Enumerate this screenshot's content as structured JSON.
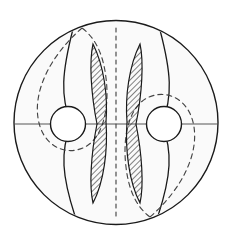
{
  "figure": {
    "canvas": {
      "width": 234,
      "height": 243
    },
    "colors": {
      "background": "#ffffff",
      "disk_fill": "#fafafa",
      "stroke": "#1a1a1a",
      "dashed_stroke": "#444444",
      "hole_fill": "#ffffff",
      "hatch_stroke": "#1a1a1a",
      "axis_line": "#555555"
    },
    "outer_disk": {
      "name": "outer-disk",
      "center_x": 116,
      "center_y": 122.5,
      "radius": 102,
      "stroke_width": 1.4
    },
    "holes": [
      {
        "name": "left-hole",
        "center_x": 68,
        "center_y": 124,
        "radius": 17.5
      },
      {
        "name": "right-hole",
        "center_x": 164,
        "center_y": 124,
        "radius": 17.5
      }
    ],
    "axis": {
      "name": "horizontal-diameter",
      "y": 124,
      "x_start": 14,
      "x_end": 218
    },
    "center_dashed_line": {
      "name": "center-dashed-line",
      "x": 116,
      "y_start": 28,
      "y_end": 218,
      "dash": "4 4"
    },
    "solid_arcs": [
      {
        "name": "left-solid-arc",
        "path": "M 73,29 C 62,72 60,96 71,124 C 60,152 62,176 75,216"
      },
      {
        "name": "right-solid-arc",
        "path": "M 160,30 C 171,72 173,96 162,124 C 173,152 171,176 158,216"
      }
    ],
    "dashed_loops": [
      {
        "name": "left-dashed-loop",
        "path": "M 82,28 C 48,58 34,92 38,118 C 42,145 64,156 83,148 C 102,140 110,110 106,78 C 103,52 94,37 82,28 Z",
        "dash": "5 4"
      },
      {
        "name": "right-dashed-loop",
        "path": "M 150,217 C 184,187 198,153 194,127 C 190,100 168,89 149,97 C 130,105 122,135 126,167 C 129,193 138,208 150,217 Z",
        "dash": "5 4"
      }
    ],
    "hatched_regions": [
      {
        "name": "left-hatched-crescent",
        "path": "M 93,44 C 104,66 108,96 106,122 C 108,150 104,182 93,203 C 89,186 91,154 97,124 C 91,94 89,62 93,44 Z",
        "hatch_angle_degrees": 45,
        "hatch_spacing": 4
      },
      {
        "name": "right-hatched-crescent",
        "path": "M 140,44 C 129,66 125,96 127,122 C 125,150 129,182 140,203 C 144,186 142,154 136,124 C 142,94 144,62 140,44 Z",
        "hatch_angle_degrees": 45,
        "hatch_spacing": 4
      }
    ]
  }
}
